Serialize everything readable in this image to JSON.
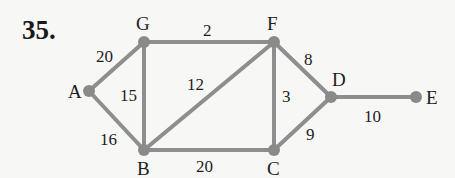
{
  "problem": {
    "number": "35."
  },
  "style": {
    "edge_color": "#8e8e8e",
    "node_color": "#8a8a8a",
    "text_color": "#1e1e1e",
    "background": "#f7f7f5"
  },
  "graph": {
    "vertices": [
      {
        "id": "A",
        "label": "A",
        "x": 89,
        "y": 91,
        "lx": 68,
        "ly": 98
      },
      {
        "id": "G",
        "label": "G",
        "x": 144,
        "y": 42,
        "lx": 136,
        "ly": 30
      },
      {
        "id": "F",
        "label": "F",
        "x": 274,
        "y": 42,
        "lx": 267,
        "ly": 30
      },
      {
        "id": "D",
        "label": "D",
        "x": 331,
        "y": 97,
        "lx": 332,
        "ly": 86
      },
      {
        "id": "E",
        "label": "E",
        "x": 416,
        "y": 97,
        "lx": 426,
        "ly": 104
      },
      {
        "id": "B",
        "label": "B",
        "x": 144,
        "y": 150,
        "lx": 137,
        "ly": 175
      },
      {
        "id": "C",
        "label": "C",
        "x": 274,
        "y": 150,
        "lx": 267,
        "ly": 175
      }
    ],
    "edges": [
      {
        "from": "A",
        "to": "G",
        "weight": "20",
        "lx": 96,
        "ly": 62
      },
      {
        "from": "A",
        "to": "B",
        "weight": "16",
        "lx": 100,
        "ly": 145
      },
      {
        "from": "G",
        "to": "B",
        "weight": "15",
        "lx": 120,
        "ly": 101
      },
      {
        "from": "G",
        "to": "F",
        "weight": "2",
        "lx": 203,
        "ly": 36
      },
      {
        "from": "B",
        "to": "F",
        "weight": "12",
        "lx": 187,
        "ly": 90
      },
      {
        "from": "B",
        "to": "C",
        "weight": "20",
        "lx": 196,
        "ly": 172
      },
      {
        "from": "F",
        "to": "C",
        "weight": "3",
        "lx": 282,
        "ly": 102
      },
      {
        "from": "F",
        "to": "D",
        "weight": "8",
        "lx": 304,
        "ly": 65
      },
      {
        "from": "C",
        "to": "D",
        "weight": "9",
        "lx": 306,
        "ly": 140
      },
      {
        "from": "D",
        "to": "E",
        "weight": "10",
        "lx": 364,
        "ly": 122
      }
    ]
  }
}
